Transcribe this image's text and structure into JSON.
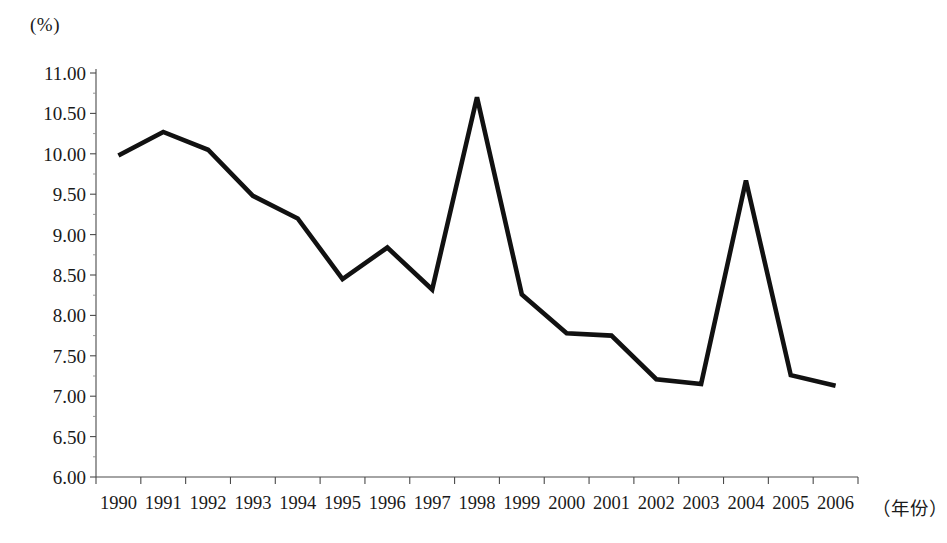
{
  "chart_data": {
    "type": "line",
    "title": "",
    "subtitle": "",
    "xlabel": "（年份）",
    "ylabel": "(%)",
    "categories": [
      "1990",
      "1991",
      "1992",
      "1993",
      "1994",
      "1995",
      "1996",
      "1997",
      "1998",
      "1999",
      "2000",
      "2001",
      "2002",
      "2003",
      "2004",
      "2005",
      "2006"
    ],
    "values": [
      9.98,
      10.27,
      10.05,
      9.48,
      9.2,
      8.45,
      8.84,
      8.32,
      10.7,
      8.26,
      7.78,
      7.75,
      7.21,
      7.15,
      9.67,
      7.26,
      7.13
    ],
    "series": [
      {
        "name": "",
        "values": [
          9.98,
          10.27,
          10.05,
          9.48,
          9.2,
          8.45,
          8.84,
          8.32,
          10.7,
          8.26,
          7.78,
          7.75,
          7.21,
          7.15,
          9.67,
          7.26,
          7.13
        ]
      }
    ],
    "ylim": [
      6.0,
      11.0
    ],
    "ytick_step": 0.5,
    "ytick_labels": [
      "11.00",
      "10.50",
      "10.00",
      "9.50",
      "9.00",
      "8.50",
      "8.00",
      "7.50",
      "7.00",
      "6.50",
      "6.00"
    ],
    "ytick_values": [
      11.0,
      10.5,
      10.0,
      9.5,
      9.0,
      8.5,
      8.0,
      7.5,
      7.0,
      6.5,
      6.0
    ],
    "xtick_labels": [
      "1990",
      "1991",
      "1992",
      "1993",
      "1994",
      "1995",
      "1996",
      "1997",
      "1998",
      "1999",
      "2000",
      "2001",
      "2002",
      "2003",
      "2004",
      "2005",
      "2006"
    ],
    "grid": false,
    "legend": "none",
    "line_color": "#111111",
    "axis_color": "#4a4a4a",
    "background_color": "#ffffff"
  },
  "axes": {
    "y_unit_label": "(%)",
    "x_unit_label": "（年份）"
  },
  "caption": {
    "text": ""
  }
}
